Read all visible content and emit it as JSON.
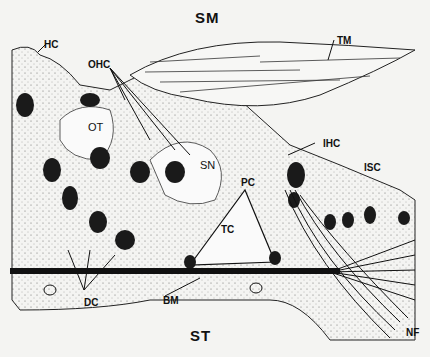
{
  "figure": {
    "regions": {
      "top": "SM",
      "bottom": "ST"
    },
    "labels": [
      {
        "id": "HC",
        "text": "HC",
        "x": 44,
        "y": 40
      },
      {
        "id": "TM",
        "text": "TM",
        "x": 337,
        "y": 36
      },
      {
        "id": "OHC",
        "text": "OHC",
        "x": 88,
        "y": 60
      },
      {
        "id": "OT",
        "text": "OT",
        "x": 88,
        "y": 122
      },
      {
        "id": "SN",
        "text": "SN",
        "x": 200,
        "y": 160
      },
      {
        "id": "PC",
        "text": "PC",
        "x": 241,
        "y": 178
      },
      {
        "id": "IHC",
        "text": "IHC",
        "x": 323,
        "y": 139
      },
      {
        "id": "ISC",
        "text": "ISC",
        "x": 364,
        "y": 163
      },
      {
        "id": "TC",
        "text": "TC",
        "x": 221,
        "y": 225
      },
      {
        "id": "DC",
        "text": "DC",
        "x": 84,
        "y": 298
      },
      {
        "id": "BM",
        "text": "BM",
        "x": 163,
        "y": 296
      },
      {
        "id": "NF",
        "text": "NF",
        "x": 406,
        "y": 328
      }
    ]
  }
}
